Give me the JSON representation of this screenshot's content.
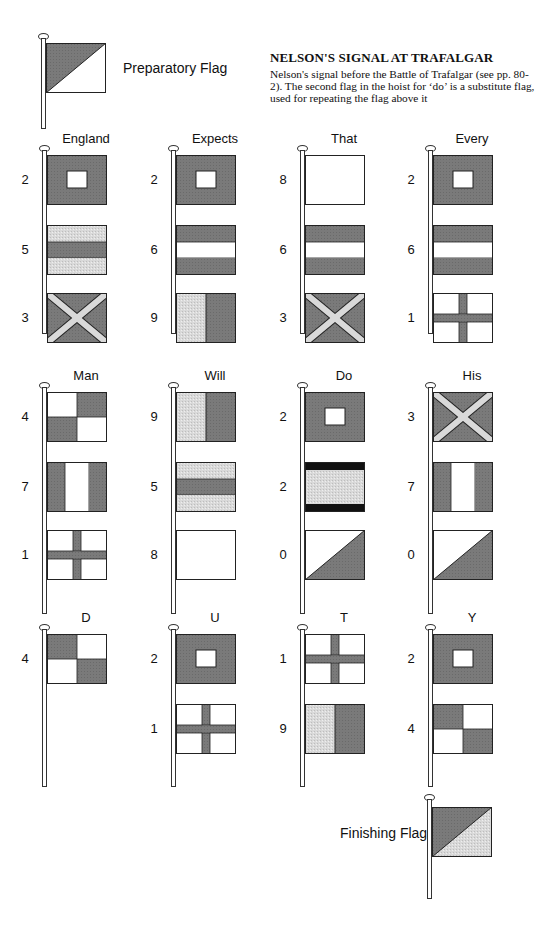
{
  "colors": {
    "dark": "#7a7a7a",
    "light": "#d9d9d9",
    "white": "#ffffff",
    "black": "#111111",
    "outline": "#222222"
  },
  "header": {
    "title": "NELSON'S SIGNAL AT TRAFALGAR",
    "description": "Nelson's signal before the Battle of Trafalgar (see pp. 80-2). The second flag in the hoist for ‘do’ is a substitute flag, used for repeating the flag above it"
  },
  "preparatory": {
    "label": "Preparatory Flag",
    "flag": "half-dark-top-left"
  },
  "finishing": {
    "label": "Finishing Flag",
    "flag": "half-dark-top-left-light-bottom"
  },
  "words": [
    {
      "word": "England",
      "hoist": [
        {
          "num": "2",
          "flag": "square-window"
        },
        {
          "num": "5",
          "flag": "light-dark-light-horizontal"
        },
        {
          "num": "3",
          "flag": "saltire"
        }
      ]
    },
    {
      "word": "Expects",
      "hoist": [
        {
          "num": "2",
          "flag": "square-window"
        },
        {
          "num": "6",
          "flag": "dark-white-dark-horizontal"
        },
        {
          "num": "9",
          "flag": "light-dark-vertical"
        }
      ]
    },
    {
      "word": "That",
      "hoist": [
        {
          "num": "8",
          "flag": "plain-white"
        },
        {
          "num": "6",
          "flag": "dark-white-dark-horizontal"
        },
        {
          "num": "3",
          "flag": "saltire"
        }
      ]
    },
    {
      "word": "Every",
      "hoist": [
        {
          "num": "2",
          "flag": "square-window"
        },
        {
          "num": "6",
          "flag": "dark-white-dark-horizontal"
        },
        {
          "num": "1",
          "flag": "cross"
        }
      ]
    },
    {
      "word": "Man",
      "hoist": [
        {
          "num": "4",
          "flag": "quartered-white-first"
        },
        {
          "num": "7",
          "flag": "dark-white-dark-vertical"
        },
        {
          "num": "1",
          "flag": "cross"
        }
      ]
    },
    {
      "word": "Will",
      "hoist": [
        {
          "num": "9",
          "flag": "light-dark-vertical"
        },
        {
          "num": "5",
          "flag": "light-dark-light-horizontal"
        },
        {
          "num": "8",
          "flag": "plain-white"
        }
      ]
    },
    {
      "word": "Do",
      "hoist": [
        {
          "num": "2",
          "flag": "square-window"
        },
        {
          "num": "2",
          "flag": "substitute-black-bands"
        },
        {
          "num": "0",
          "flag": "half-dark-bottom-right"
        }
      ]
    },
    {
      "word": "His",
      "hoist": [
        {
          "num": "3",
          "flag": "saltire"
        },
        {
          "num": "7",
          "flag": "dark-white-dark-vertical"
        },
        {
          "num": "0",
          "flag": "half-dark-bottom-right"
        }
      ]
    },
    {
      "word": "D",
      "hoist": [
        {
          "num": "4",
          "flag": "quartered-dark-first"
        }
      ]
    },
    {
      "word": "U",
      "hoist": [
        {
          "num": "2",
          "flag": "square-window"
        },
        {
          "num": "1",
          "flag": "cross"
        }
      ]
    },
    {
      "word": "T",
      "hoist": [
        {
          "num": "1",
          "flag": "cross"
        },
        {
          "num": "9",
          "flag": "light-dark-vertical"
        }
      ]
    },
    {
      "word": "Y",
      "hoist": [
        {
          "num": "2",
          "flag": "square-window"
        },
        {
          "num": "4",
          "flag": "quartered-dark-first"
        }
      ]
    }
  ]
}
